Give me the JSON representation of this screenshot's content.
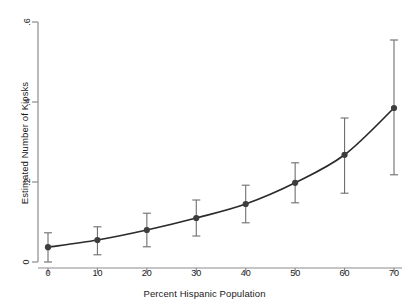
{
  "chart_data": {
    "type": "line",
    "title": "",
    "xlabel": "Percent Hispanic Population",
    "ylabel": "Estimated Number of Kiosks",
    "x": [
      0,
      10,
      20,
      30,
      40,
      50,
      60,
      70
    ],
    "values": [
      0.037,
      0.055,
      0.08,
      0.11,
      0.145,
      0.198,
      0.268,
      0.385
    ],
    "error_low": [
      0.0,
      0.018,
      0.038,
      0.065,
      0.098,
      0.148,
      0.172,
      0.218
    ],
    "error_high": [
      0.073,
      0.088,
      0.122,
      0.155,
      0.192,
      0.248,
      0.36,
      0.555
    ],
    "xticks": [
      "0",
      "10",
      "20",
      "30",
      "40",
      "50",
      "60",
      "70"
    ],
    "yticks": [
      "0",
      ".2",
      ".4",
      ".6"
    ],
    "ytick_values": [
      0,
      0.2,
      0.4,
      0.6
    ],
    "xlim": [
      -1.5,
      72
    ],
    "ylim": [
      0,
      0.6
    ],
    "grid": false,
    "legend": "none",
    "series_name": "Estimated Number of Kiosks",
    "marker": "filled-circle",
    "error_bar_style": "capped-vertical",
    "line_color": "#2b2b2b",
    "marker_color": "#3d3d3d",
    "error_color": "#6e6e6e",
    "axis_color": "#8c8c8c"
  }
}
